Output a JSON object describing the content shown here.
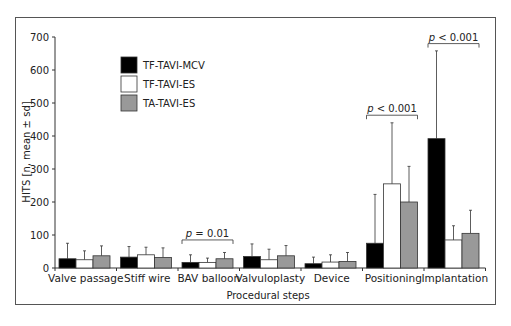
{
  "chart_data": {
    "type": "bar",
    "title": "",
    "xlabel": "Procedural steps",
    "ylabel": "HITS [n, mean ± sd]",
    "ylim": [
      0,
      700
    ],
    "yticks": [
      0,
      100,
      200,
      300,
      400,
      500,
      600,
      700
    ],
    "grid": false,
    "legend_position": "upper-left",
    "categories": [
      "Valve passage",
      "Stiff wire",
      "BAV balloon",
      "Valvuloplasty",
      "Device",
      "Positioning",
      "Implantation"
    ],
    "series": [
      {
        "name": "TF-TAVI-MCV",
        "color": "#000000",
        "values": [
          28,
          33,
          17,
          35,
          13,
          75,
          392
        ],
        "sd_upper": [
          75,
          65,
          40,
          73,
          33,
          223,
          658
        ]
      },
      {
        "name": "TF-TAVI-ES",
        "color": "#ffffff",
        "values": [
          25,
          40,
          17,
          25,
          18,
          255,
          85
        ],
        "sd_upper": [
          52,
          63,
          30,
          57,
          40,
          440,
          128
        ]
      },
      {
        "name": "TA-TAVI-ES",
        "color": "#999999",
        "values": [
          37,
          32,
          28,
          37,
          20,
          200,
          105
        ],
        "sd_upper": [
          67,
          61,
          47,
          68,
          47,
          308,
          175
        ]
      }
    ],
    "annotations": [
      {
        "category": "BAV balloon",
        "text_prefix": "p",
        "text": " = 0.01",
        "bracket_y": 85
      },
      {
        "category": "Positioning",
        "text_prefix": "p",
        "text": " < 0.001",
        "bracket_y": 463
      },
      {
        "category": "Implantation",
        "text_prefix": "p",
        "text": " < 0.001",
        "bracket_y": 680
      }
    ]
  }
}
